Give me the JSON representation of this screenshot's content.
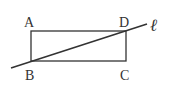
{
  "diagram": {
    "type": "geometry",
    "stroke_color": "#333333",
    "rectangle": {
      "vertices": {
        "A": {
          "label": "A",
          "x": 31,
          "y": 31
        },
        "B": {
          "label": "B",
          "x": 31,
          "y": 61
        },
        "C": {
          "label": "C",
          "x": 126,
          "y": 61
        },
        "D": {
          "label": "D",
          "x": 126,
          "y": 31
        }
      }
    },
    "line": {
      "label": "ℓ",
      "x1": 11,
      "y1": 68,
      "x2": 147,
      "y2": 24,
      "passes_through": [
        "B",
        "D"
      ]
    }
  }
}
